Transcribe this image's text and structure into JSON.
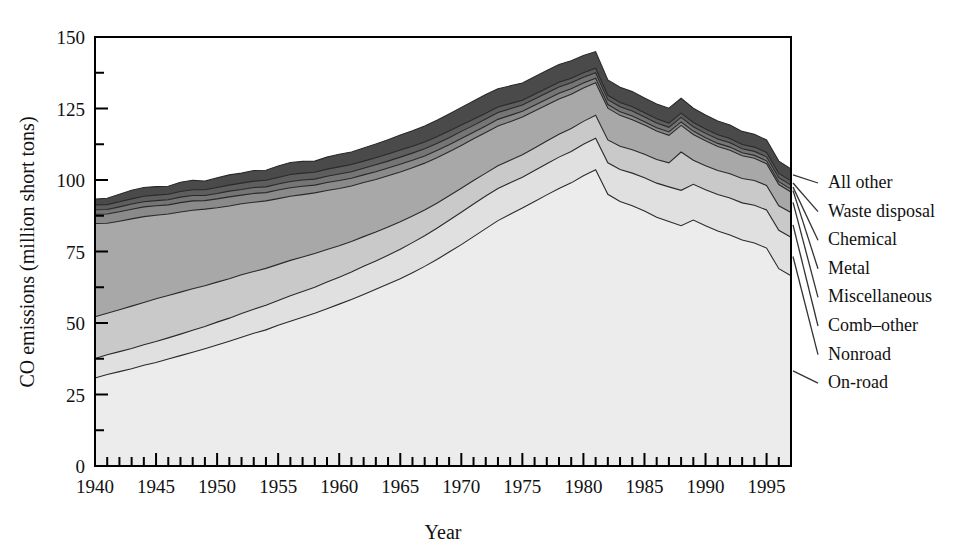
{
  "chart_data": {
    "type": "area",
    "stacked": true,
    "title": "",
    "subtitle": "",
    "xlabel": "Year",
    "ylabel": "CO emissions (million short tons)",
    "xlim": [
      1940,
      1997
    ],
    "ylim": [
      0,
      150
    ],
    "grid": false,
    "legend_position": "right-outside-labels-with-leader-lines",
    "y_major_ticks": [
      0,
      25,
      50,
      75,
      100,
      125,
      150
    ],
    "y_minor_tick_step": 12.5,
    "x_major_ticks": [
      1940,
      1945,
      1950,
      1955,
      1960,
      1965,
      1970,
      1975,
      1980,
      1985,
      1990,
      1995
    ],
    "x_minor_tick_step": 1,
    "x_tick_labels": [
      "1940",
      "1945",
      "1950",
      "1955",
      "1960",
      "1965",
      "1970",
      "1975",
      "1980",
      "1985",
      "1990",
      "1995"
    ],
    "y_tick_labels": [
      "0",
      "25",
      "50",
      "75",
      "100",
      "125",
      "150"
    ],
    "x": [
      1940,
      1941,
      1942,
      1943,
      1944,
      1945,
      1946,
      1947,
      1948,
      1949,
      1950,
      1951,
      1952,
      1953,
      1954,
      1955,
      1956,
      1957,
      1958,
      1959,
      1960,
      1961,
      1962,
      1963,
      1964,
      1965,
      1966,
      1967,
      1968,
      1969,
      1970,
      1971,
      1972,
      1973,
      1974,
      1975,
      1976,
      1977,
      1978,
      1979,
      1980,
      1981,
      1982,
      1983,
      1984,
      1985,
      1986,
      1987,
      1988,
      1989,
      1990,
      1991,
      1992,
      1993,
      1994,
      1995,
      1996,
      1997
    ],
    "series": [
      {
        "name": "On-road",
        "color": "#ececec",
        "values": [
          30.8,
          32.0,
          33.0,
          34.0,
          35.2,
          36.2,
          37.4,
          38.6,
          39.8,
          41.0,
          42.3,
          43.6,
          45.0,
          46.4,
          47.6,
          49.2,
          50.6,
          52.0,
          53.4,
          55.0,
          56.6,
          58.2,
          60.0,
          61.8,
          63.6,
          65.5,
          67.6,
          69.8,
          72.2,
          74.8,
          77.4,
          80.2,
          83.0,
          85.8,
          88.0,
          90.2,
          92.5,
          94.8,
          97.0,
          99.0,
          101.5,
          103.6,
          95.0,
          92.5,
          91.0,
          89.2,
          87.0,
          85.5,
          84.0,
          86.0,
          84.0,
          82.2,
          80.8,
          79.0,
          78.0,
          76.2,
          69.0,
          66.5
        ]
      },
      {
        "name": "Nonroad",
        "color": "#e0e0e0",
        "values": [
          6.8,
          6.9,
          7.0,
          7.1,
          7.2,
          7.3,
          7.4,
          7.5,
          7.7,
          7.8,
          8.0,
          8.1,
          8.3,
          8.4,
          8.6,
          8.7,
          8.9,
          9.0,
          9.1,
          9.3,
          9.4,
          9.6,
          9.8,
          9.9,
          10.1,
          10.3,
          10.5,
          10.7,
          10.9,
          11.1,
          11.3,
          11.4,
          11.4,
          11.2,
          11.0,
          10.8,
          10.8,
          10.9,
          11.0,
          11.0,
          11.0,
          11.0,
          11.0,
          11.2,
          11.4,
          11.6,
          11.9,
          12.1,
          12.4,
          12.5,
          12.6,
          12.7,
          12.9,
          13.0,
          13.2,
          13.3,
          13.4,
          13.5
        ]
      },
      {
        "name": "Comb-other",
        "color": "#c9c9c9",
        "values": [
          14.6,
          14.5,
          14.6,
          14.8,
          14.8,
          15.0,
          14.8,
          14.7,
          14.5,
          14.2,
          14.0,
          13.8,
          13.6,
          13.2,
          12.9,
          12.6,
          12.4,
          12.1,
          11.8,
          11.4,
          11.0,
          10.7,
          10.4,
          10.1,
          9.9,
          9.6,
          9.3,
          9.0,
          8.8,
          8.6,
          8.4,
          8.2,
          8.0,
          8.0,
          7.9,
          7.8,
          7.9,
          7.9,
          8.0,
          8.0,
          8.0,
          8.0,
          8.0,
          8.1,
          8.2,
          8.2,
          8.3,
          8.4,
          13.4,
          8.4,
          8.4,
          8.4,
          8.5,
          8.5,
          8.6,
          8.6,
          8.6,
          8.6
        ]
      },
      {
        "name": "Miscellaneous",
        "color": "#a8a8a8",
        "values": [
          32.6,
          31.5,
          31.0,
          30.5,
          30.0,
          29.2,
          28.5,
          28.0,
          27.4,
          26.8,
          26.0,
          25.4,
          24.8,
          24.2,
          23.6,
          23.0,
          22.4,
          21.8,
          21.2,
          20.6,
          20.0,
          19.4,
          18.9,
          18.4,
          17.9,
          17.4,
          16.9,
          16.4,
          15.9,
          15.4,
          15.0,
          14.6,
          14.2,
          13.9,
          13.5,
          13.2,
          12.9,
          12.6,
          12.3,
          12.0,
          11.7,
          11.4,
          11.1,
          10.8,
          10.5,
          10.2,
          9.9,
          9.6,
          9.3,
          9.0,
          8.7,
          8.4,
          8.2,
          8.0,
          7.8,
          7.6,
          7.4,
          7.2
        ]
      },
      {
        "name": "Metal",
        "color": "#8a8a8a",
        "values": [
          3.2,
          3.2,
          3.3,
          3.4,
          3.4,
          3.3,
          3.2,
          3.3,
          3.3,
          3.0,
          3.1,
          3.2,
          3.0,
          3.1,
          2.9,
          3.0,
          3.0,
          2.9,
          2.7,
          2.8,
          2.8,
          2.7,
          2.7,
          2.7,
          2.7,
          2.7,
          2.6,
          2.5,
          2.5,
          2.4,
          2.4,
          2.3,
          2.3,
          2.3,
          2.2,
          2.0,
          2.0,
          2.0,
          2.0,
          1.9,
          1.7,
          1.6,
          1.3,
          1.3,
          1.3,
          1.2,
          1.2,
          1.2,
          1.2,
          1.2,
          1.1,
          1.1,
          1.1,
          1.0,
          1.0,
          1.0,
          1.0,
          1.0
        ]
      },
      {
        "name": "Chemical",
        "color": "#757575",
        "values": [
          1.6,
          1.6,
          1.7,
          1.8,
          1.8,
          1.8,
          1.8,
          1.9,
          1.9,
          1.8,
          1.9,
          2.0,
          2.0,
          2.1,
          2.0,
          2.1,
          2.2,
          2.2,
          2.1,
          2.2,
          2.3,
          2.3,
          2.3,
          2.4,
          2.4,
          2.5,
          2.5,
          2.5,
          2.5,
          2.5,
          2.5,
          2.4,
          2.4,
          2.4,
          2.3,
          2.2,
          2.2,
          2.2,
          2.2,
          2.1,
          2.0,
          1.9,
          1.7,
          1.7,
          1.7,
          1.6,
          1.6,
          1.6,
          1.6,
          1.5,
          1.5,
          1.5,
          1.5,
          1.4,
          1.4,
          1.4,
          1.4,
          1.4
        ]
      },
      {
        "name": "Waste disposal",
        "color": "#5e5e5e",
        "values": [
          1.7,
          1.7,
          1.8,
          1.8,
          1.9,
          1.9,
          1.9,
          2.0,
          2.0,
          2.0,
          2.1,
          2.1,
          2.2,
          2.2,
          2.3,
          2.3,
          2.4,
          2.4,
          2.4,
          2.5,
          2.5,
          2.5,
          2.5,
          2.5,
          2.5,
          2.5,
          2.4,
          2.4,
          2.3,
          2.3,
          2.2,
          2.1,
          2.0,
          1.9,
          1.8,
          1.7,
          1.7,
          1.7,
          1.7,
          1.6,
          1.6,
          1.6,
          1.5,
          1.5,
          1.5,
          1.5,
          1.5,
          1.5,
          1.5,
          1.5,
          1.5,
          1.5,
          1.5,
          1.5,
          1.5,
          1.5,
          1.5,
          1.5
        ]
      },
      {
        "name": "All other",
        "color": "#4a4a4a",
        "values": [
          2.0,
          2.2,
          2.6,
          3.0,
          3.1,
          3.0,
          2.8,
          3.2,
          3.3,
          3.0,
          3.4,
          3.6,
          3.5,
          3.7,
          3.5,
          4.0,
          4.2,
          4.1,
          3.9,
          4.2,
          4.4,
          4.4,
          4.6,
          4.8,
          5.0,
          5.2,
          5.4,
          5.6,
          5.8,
          6.0,
          6.2,
          6.4,
          6.6,
          6.4,
          6.2,
          6.0,
          6.1,
          6.2,
          6.2,
          6.1,
          6.0,
          5.8,
          5.4,
          5.3,
          5.3,
          5.2,
          5.2,
          5.2,
          5.2,
          5.0,
          4.9,
          4.8,
          4.7,
          4.6,
          4.5,
          4.4,
          4.3,
          4.2
        ]
      }
    ],
    "legend_entries": [
      {
        "label": "All other"
      },
      {
        "label": "Waste disposal"
      },
      {
        "label": "Chemical"
      },
      {
        "label": "Metal"
      },
      {
        "label": "Miscellaneous"
      },
      {
        "label": "Comb–other"
      },
      {
        "label": "Nonroad"
      },
      {
        "label": "On-road"
      }
    ],
    "colors": {
      "axis": "#000000",
      "outline": "#2a2a2a",
      "background": "#ffffff"
    }
  }
}
